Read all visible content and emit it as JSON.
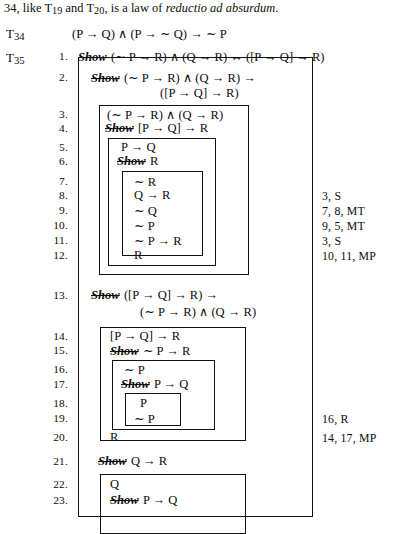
{
  "prose": {
    "before": "34, like T",
    "sub1": "19",
    "mid": " and T",
    "sub2": "20",
    "after": ", is a law of ",
    "italic": "reductio ad absurdum",
    "period": "."
  },
  "theorems": {
    "t34": {
      "label": "T34",
      "sub": "34",
      "prefix": "T",
      "formula": "(P → Q) ∧ (P → ∼ Q) → ∼ P"
    },
    "t35": {
      "label": "T35",
      "sub": "35",
      "prefix": "T"
    }
  },
  "derivation": {
    "lines": [
      {
        "n": "1.",
        "show": "Show",
        "formula": "(∼ P → R) ∧ (Q → R) ↔ ([P → Q] → R)",
        "just": ""
      },
      {
        "n": "2.",
        "show": "Show",
        "formula": "(∼ P → R) ∧ (Q → R) →",
        "formula2": "([P → Q] → R)",
        "just": ""
      },
      {
        "n": "3.",
        "show": "",
        "formula": "(∼ P → R) ∧ (Q → R)",
        "just": ""
      },
      {
        "n": "4.",
        "show": "Show",
        "formula": "[P → Q] → R",
        "just": ""
      },
      {
        "n": "5.",
        "show": "",
        "formula": "P → Q",
        "just": ""
      },
      {
        "n": "6.",
        "show": "Show",
        "formula": "R",
        "just": ""
      },
      {
        "n": "7.",
        "show": "",
        "formula": "∼ R",
        "just": ""
      },
      {
        "n": "8.",
        "show": "",
        "formula": "Q → R",
        "just": "3, S"
      },
      {
        "n": "9.",
        "show": "",
        "formula": "∼ Q",
        "just": "7, 8, MT"
      },
      {
        "n": "10.",
        "show": "",
        "formula": "∼ P",
        "just": "9, 5, MT"
      },
      {
        "n": "11.",
        "show": "",
        "formula": "∼ P → R",
        "just": "3, S"
      },
      {
        "n": "12.",
        "show": "",
        "formula": "R",
        "just": "10, 11, MP"
      },
      {
        "n": "13.",
        "show": "Show",
        "formula": "([P → Q] → R) →",
        "formula2": "(∼ P → R) ∧ (Q → R)",
        "just": ""
      },
      {
        "n": "14.",
        "show": "",
        "formula": "[P → Q] → R",
        "just": ""
      },
      {
        "n": "15.",
        "show": "Show",
        "formula": "∼ P → R",
        "just": ""
      },
      {
        "n": "16.",
        "show": "",
        "formula": "∼ P",
        "just": ""
      },
      {
        "n": "17.",
        "show": "Show",
        "formula": "P → Q",
        "just": ""
      },
      {
        "n": "18.",
        "show": "",
        "formula": "P",
        "just": ""
      },
      {
        "n": "19.",
        "show": "",
        "formula": "∼ P",
        "just": "16, R"
      },
      {
        "n": "20.",
        "show": "",
        "formula": "R",
        "just": "14, 17, MP"
      },
      {
        "n": "21.",
        "show": "Show",
        "formula": "Q → R",
        "just": ""
      },
      {
        "n": "22.",
        "show": "",
        "formula": "Q",
        "just": ""
      },
      {
        "n": "23.",
        "show": "Show",
        "formula": "P → Q",
        "just": ""
      }
    ]
  }
}
